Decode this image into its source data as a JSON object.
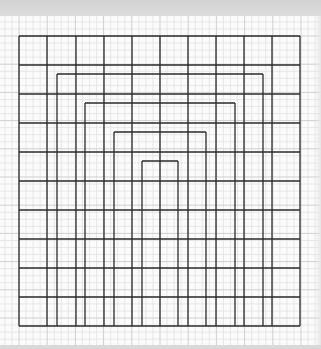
{
  "title": "Hand-drawn nested grid on graph paper",
  "colors": {
    "paper": "#fbfbfb",
    "fine_grid": "#e2e2e2",
    "major_grid": "#cfcfcf",
    "ink": "#2a2a2a",
    "shadow": "#d3d3d3"
  },
  "paper": {
    "top": 16,
    "fine_spacing": 7.05,
    "major_every": 4
  },
  "drawing": {
    "outer": {
      "x1": 19,
      "y1": 36,
      "x2": 300,
      "y2": 326
    },
    "vertical_lines_x": [
      19,
      47,
      76,
      104,
      132,
      160,
      188,
      216,
      244,
      272,
      300
    ],
    "horizontal_lines_y": [
      36,
      65,
      94,
      123,
      152,
      181,
      210,
      239,
      268,
      297,
      326
    ],
    "nested_arches": [
      {
        "top_y": 74,
        "left_x": 57,
        "right_x": 263
      },
      {
        "top_y": 103,
        "left_x": 85,
        "right_x": 235
      },
      {
        "top_y": 132,
        "left_x": 114,
        "right_x": 206
      },
      {
        "top_y": 161,
        "left_x": 142,
        "right_x": 178
      }
    ],
    "bottom_y": 326
  }
}
